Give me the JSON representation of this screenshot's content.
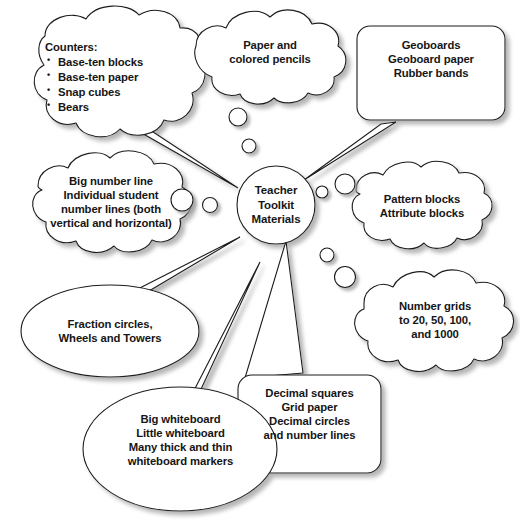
{
  "diagram": {
    "title": "Teacher Toolkit Materials",
    "type": "thought-bubble-mind-map",
    "background_color": "#ffffff",
    "stroke_color": "#1a1a1a",
    "text_color": "#161616",
    "shadow_color": "#b8b8b8",
    "center": {
      "label": "Teacher\nToolkit\nMaterials",
      "shape": "circle"
    },
    "nodes": [
      {
        "id": "counters",
        "shape": "cloud",
        "title": "Counters:",
        "items": [
          "Base-ten blocks",
          "Base-ten paper",
          "Snap cubes",
          "Bears"
        ],
        "label": "Counters:"
      },
      {
        "id": "paper",
        "shape": "cloud",
        "label": "Paper and\ncolored pencils"
      },
      {
        "id": "geoboards",
        "shape": "rounded-rectangle",
        "label": "Geoboards\nGeoboard paper\nRubber bands"
      },
      {
        "id": "number-lines",
        "shape": "cloud",
        "label": "Big number line\nIndividual student\nnumber lines (both\nvertical and horizontal)"
      },
      {
        "id": "pattern-blocks",
        "shape": "cloud",
        "label": "Pattern blocks\nAttribute blocks"
      },
      {
        "id": "number-grids",
        "shape": "cloud",
        "label": "Number grids\nto 20, 50, 100,\nand 1000"
      },
      {
        "id": "fraction-circles",
        "shape": "ellipse",
        "label": "Fraction circles,\nWheels and Towers"
      },
      {
        "id": "decimal-squares",
        "shape": "rounded-rectangle",
        "label": "Decimal squares\nGrid paper\nDecimal circles\nand number lines"
      },
      {
        "id": "whiteboards",
        "shape": "ellipse",
        "label": "Big whiteboard\nLittle whiteboard\nMany thick and thin\nwhiteboard markers"
      }
    ]
  }
}
